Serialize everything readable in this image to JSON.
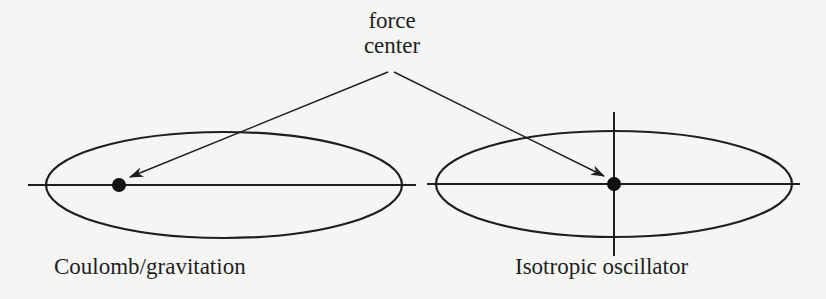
{
  "figure": {
    "annotation": {
      "line1": "force",
      "line2": "center"
    },
    "panels": [
      {
        "id": "coulomb",
        "caption": "Coulomb/gravitation",
        "force_center_position": "focus"
      },
      {
        "id": "oscillator",
        "caption": "Isotropic oscillator",
        "force_center_position": "center"
      }
    ],
    "colors": {
      "ink": "#1e1e1e",
      "background": "#f5f5f3"
    }
  }
}
